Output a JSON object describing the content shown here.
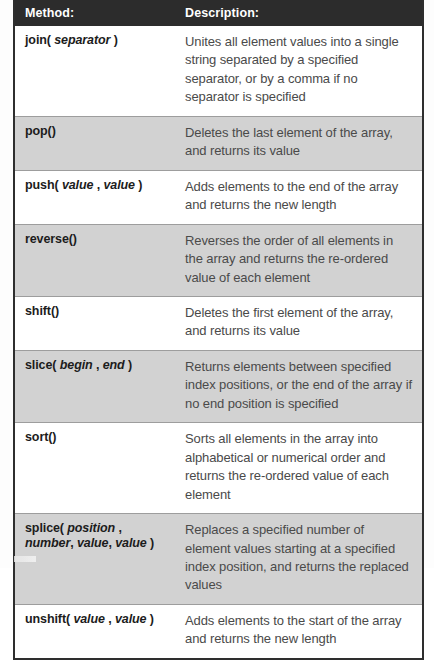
{
  "document": {
    "kind": "reference-table",
    "subject": "JavaScript Array object methods"
  },
  "colors": {
    "header_background": "#2c2c2c",
    "header_text": "#ffffff",
    "row_white": "#ffffff",
    "row_gray": "#d2d2d2",
    "border": "#2e2e2e",
    "row_divider": "#9d9d9d",
    "method_text": "#1c1c1c",
    "description_text": "#4a4a4a"
  },
  "table": {
    "columns": [
      {
        "key": "method",
        "label": "Method:"
      },
      {
        "key": "description",
        "label": "Description:"
      }
    ],
    "rows": [
      {
        "method_plain": "join( separator )",
        "method_prefix": "join( ",
        "method_param": "separator",
        "method_suffix": " )",
        "method_line2_prefix": "",
        "method_line2_param": "",
        "method_line2_suffix": "",
        "description": "Unites all element values into a single string separated by a specified separator, or by a comma if no separator is specified",
        "shade": "white"
      },
      {
        "method_plain": "pop()",
        "method_prefix": "pop()",
        "method_param": "",
        "method_suffix": "",
        "method_line2_prefix": "",
        "method_line2_param": "",
        "method_line2_suffix": "",
        "description": "Deletes the last element of the array, and returns its value",
        "shade": "gray"
      },
      {
        "method_plain": "push( value , value )",
        "method_prefix": "push( ",
        "method_param": "value",
        "method_suffix": " , ",
        "method_param2": "value",
        "method_suffix2": " )",
        "description": "Adds elements to the end of the array and returns the new length",
        "shade": "white"
      },
      {
        "method_plain": "reverse()",
        "method_prefix": "reverse()",
        "method_param": "",
        "method_suffix": "",
        "description": "Reverses the order of all elements in the array and returns the re-ordered value of each element",
        "shade": "gray"
      },
      {
        "method_plain": "shift()",
        "method_prefix": "shift()",
        "method_param": "",
        "method_suffix": "",
        "description": "Deletes the first element of the array, and returns its value",
        "shade": "white"
      },
      {
        "method_plain": "slice( begin , end )",
        "method_prefix": "slice( ",
        "method_param": "begin",
        "method_suffix": " , ",
        "method_param2": "end",
        "method_suffix2": " )",
        "description": "Returns elements between specified index positions, or the end of the array if no end position is specified",
        "shade": "gray"
      },
      {
        "method_plain": "sort()",
        "method_prefix": "sort()",
        "method_param": "",
        "method_suffix": "",
        "description": "Sorts all elements in the array into alphabetical or numerical order and returns the re-ordered value of each element",
        "shade": "white"
      },
      {
        "method_plain": "splice( position , number, value, value )",
        "method_prefix": "splice( ",
        "method_param": "position",
        "method_suffix": " ,",
        "method_line2_param": "number",
        "method_line2_mid": ", ",
        "method_line2_param2": "value",
        "method_line2_mid2": ", ",
        "method_line2_param3": "value",
        "method_line2_suffix": " )",
        "description": "Replaces a specified number of element values starting at a specified index position, and returns the replaced values",
        "shade": "gray"
      },
      {
        "method_plain": "unshift( value , value )",
        "method_prefix": "unshift( ",
        "method_param": "value",
        "method_suffix": " , ",
        "method_param2": "value",
        "method_suffix2": " )",
        "description": "Adds elements to the start of the array and returns the new length",
        "shade": "white"
      }
    ]
  }
}
